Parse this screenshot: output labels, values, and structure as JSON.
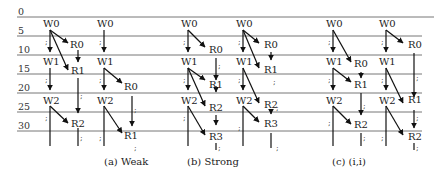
{
  "figure": {
    "time_axis": {
      "ticks": [
        "0",
        "5",
        "10",
        "15",
        "20",
        "25",
        "30"
      ]
    },
    "panels": [
      {
        "caption": "(a) Weak"
      },
      {
        "caption": "(b) Strong"
      },
      {
        "caption": "(c) (i,i)"
      }
    ],
    "labels": {
      "w0": "W0",
      "w1": "W1",
      "w2": "W2",
      "r0": "R0",
      "r1": "R1",
      "r2": "R2",
      "r3": "R3",
      "semi": ";"
    }
  }
}
